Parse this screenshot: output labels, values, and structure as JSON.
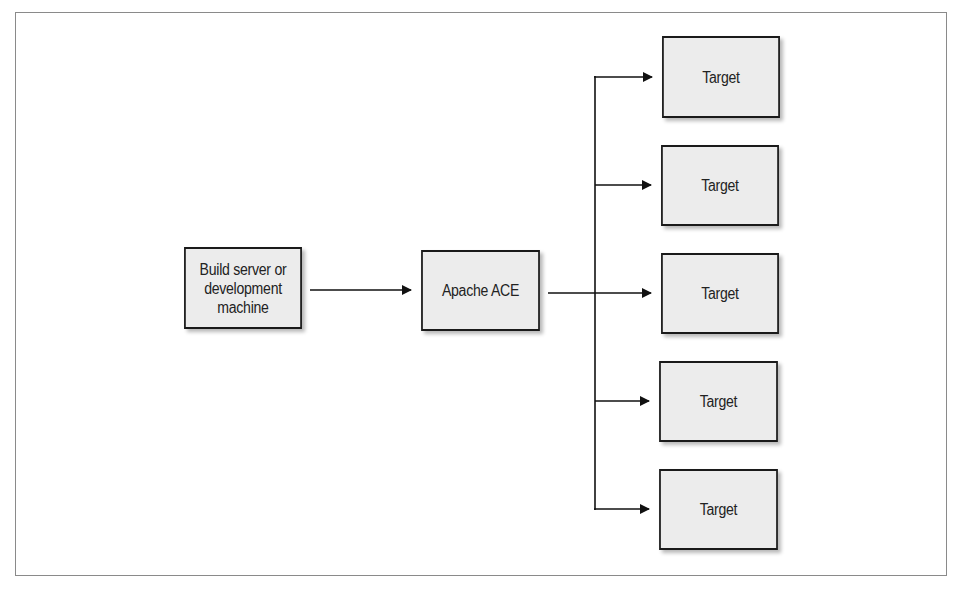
{
  "diagram": {
    "type": "flow",
    "direction": "left-to-right",
    "colors": {
      "box_fill": "#ececec",
      "box_border": "#1a1a1a",
      "line": "#111111",
      "frame": "#8a8a8a",
      "text": "#222222"
    },
    "nodes": [
      {
        "id": "build",
        "label": "Build server or\ndevelopment\nmachine",
        "x": 176,
        "y": 247,
        "w": 134,
        "h": 82
      },
      {
        "id": "ace",
        "label": "Apache ACE",
        "x": 413,
        "y": 250,
        "w": 135,
        "h": 81
      },
      {
        "id": "target1",
        "label": "Target",
        "x": 654,
        "y": 36,
        "w": 134,
        "h": 82
      },
      {
        "id": "target2",
        "label": "Target",
        "x": 653,
        "y": 145,
        "w": 134,
        "h": 81
      },
      {
        "id": "target3",
        "label": "Target",
        "x": 653,
        "y": 253,
        "w": 134,
        "h": 81
      },
      {
        "id": "target4",
        "label": "Target",
        "x": 651,
        "y": 361,
        "w": 135,
        "h": 81
      },
      {
        "id": "target5",
        "label": "Target",
        "x": 651,
        "y": 469,
        "w": 135,
        "h": 81
      }
    ],
    "edges": [
      {
        "from": "build",
        "to": "ace"
      },
      {
        "from": "ace",
        "to": "target1"
      },
      {
        "from": "ace",
        "to": "target2"
      },
      {
        "from": "ace",
        "to": "target3"
      },
      {
        "from": "ace",
        "to": "target4"
      },
      {
        "from": "ace",
        "to": "target5"
      }
    ]
  },
  "labels": {
    "build": "Build server or\ndevelopment\nmachine",
    "ace": "Apache ACE",
    "target1": "Target",
    "target2": "Target",
    "target3": "Target",
    "target4": "Target",
    "target5": "Target"
  }
}
